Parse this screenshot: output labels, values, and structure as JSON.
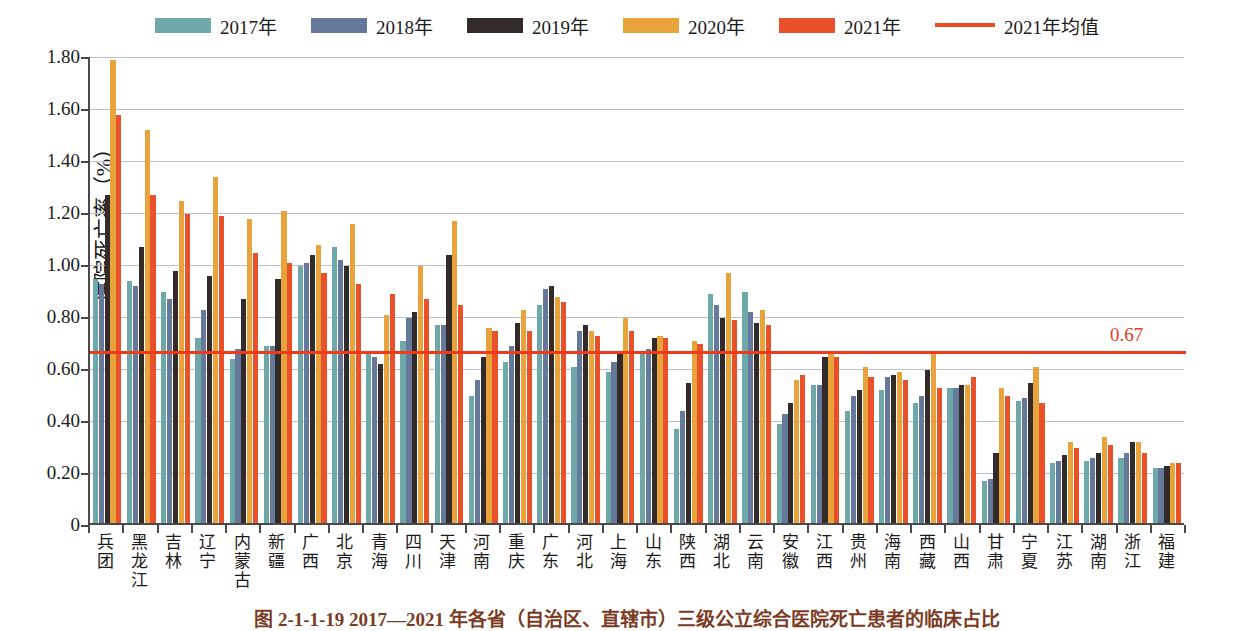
{
  "legend": {
    "items": [
      {
        "label": "2017年",
        "color": "#6FA8A8",
        "type": "swatch"
      },
      {
        "label": "2018年",
        "color": "#67799B",
        "type": "swatch"
      },
      {
        "label": "2019年",
        "color": "#332A2A",
        "type": "swatch"
      },
      {
        "label": "2020年",
        "color": "#E8A33D",
        "type": "swatch"
      },
      {
        "label": "2021年",
        "color": "#E8512A",
        "type": "swatch"
      },
      {
        "label": "2021年均值",
        "color": "#EE4B1E",
        "type": "line"
      }
    ]
  },
  "axis": {
    "y_title": "住院死亡率（%）",
    "y_ticks": [
      "1.80",
      "1.60",
      "1.40",
      "1.20",
      "1.00",
      "0.80",
      "0.60",
      "0.40",
      "0.20",
      "0"
    ]
  },
  "average": {
    "label": "0.67",
    "value": 0.67,
    "color": "#EE3B1A"
  },
  "caption": "图 2-1-1-19  2017—2021 年各省（自治区、直辖市）三级公立综合医院死亡患者的临床占比",
  "chart_data": {
    "type": "bar",
    "xlabel": "",
    "ylabel": "住院死亡率（%）",
    "ylim": [
      0,
      1.8
    ],
    "ytick_step": 0.2,
    "grid": true,
    "legend_position": "top-center",
    "annotations": [
      {
        "text": "0.67",
        "type": "average-line",
        "value": 0.67,
        "color": "#EE3B1A"
      }
    ],
    "categories": [
      "兵团",
      "黑龙江",
      "吉林",
      "辽宁",
      "内蒙古",
      "新疆",
      "广西",
      "北京",
      "青海",
      "四川",
      "天津",
      "河南",
      "重庆",
      "广东",
      "河北",
      "上海",
      "山东",
      "陕西",
      "湖北",
      "云南",
      "安徽",
      "江西",
      "贵州",
      "海南",
      "西藏",
      "山西",
      "甘肃",
      "宁夏",
      "江苏",
      "湖南",
      "浙江",
      "福建"
    ],
    "series": [
      {
        "name": "2017年",
        "color": "#6FA8A8",
        "values": [
          0.94,
          0.93,
          0.89,
          0.71,
          0.63,
          0.68,
          0.99,
          1.06,
          0.65,
          0.7,
          0.76,
          0.49,
          0.62,
          0.84,
          0.6,
          0.58,
          0.66,
          0.36,
          0.88,
          0.89,
          0.38,
          0.53,
          0.43,
          0.51,
          0.46,
          0.52,
          0.16,
          0.47,
          0.23,
          0.24,
          0.25,
          0.21
        ]
      },
      {
        "name": "2018年",
        "color": "#67799B",
        "values": [
          0.92,
          0.91,
          0.86,
          0.82,
          0.67,
          0.68,
          1.0,
          1.01,
          0.64,
          0.79,
          0.76,
          0.55,
          0.68,
          0.9,
          0.74,
          0.62,
          0.67,
          0.43,
          0.84,
          0.81,
          0.42,
          0.53,
          0.49,
          0.56,
          0.49,
          0.52,
          0.17,
          0.48,
          0.24,
          0.25,
          0.27,
          0.21
        ]
      },
      {
        "name": "2019年",
        "color": "#332A2A",
        "values": [
          1.26,
          1.06,
          0.97,
          0.95,
          0.86,
          0.94,
          1.03,
          0.99,
          0.61,
          0.81,
          1.03,
          0.64,
          0.77,
          0.91,
          0.76,
          0.66,
          0.71,
          0.54,
          0.79,
          0.77,
          0.46,
          0.64,
          0.51,
          0.57,
          0.59,
          0.53,
          0.27,
          0.54,
          0.26,
          0.27,
          0.31,
          0.22
        ]
      },
      {
        "name": "2020年",
        "color": "#E8A33D",
        "values": [
          1.78,
          1.51,
          1.24,
          1.33,
          1.17,
          1.2,
          1.07,
          1.15,
          0.8,
          0.99,
          1.16,
          0.75,
          0.82,
          0.87,
          0.74,
          0.79,
          0.72,
          0.7,
          0.96,
          0.82,
          0.55,
          0.65,
          0.6,
          0.58,
          0.65,
          0.53,
          0.52,
          0.6,
          0.31,
          0.33,
          0.31,
          0.23
        ]
      },
      {
        "name": "2021年",
        "color": "#E8512A",
        "values": [
          1.57,
          1.26,
          1.19,
          1.18,
          1.04,
          1.0,
          0.96,
          0.92,
          0.88,
          0.86,
          0.84,
          0.74,
          0.74,
          0.85,
          0.72,
          0.74,
          0.71,
          0.69,
          0.78,
          0.76,
          0.57,
          0.64,
          0.56,
          0.55,
          0.52,
          0.56,
          0.49,
          0.46,
          0.29,
          0.3,
          0.27,
          0.23
        ]
      }
    ]
  }
}
